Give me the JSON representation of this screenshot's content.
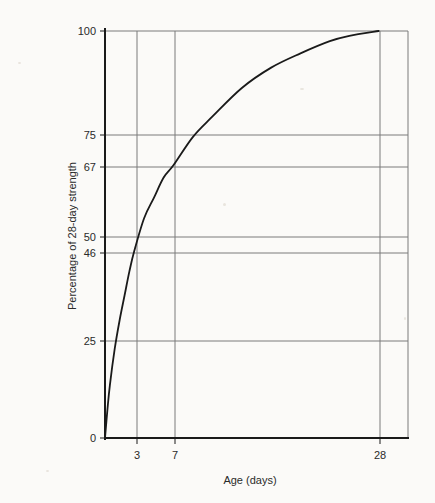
{
  "chart_data": {
    "type": "line",
    "title": "",
    "subtitle": "",
    "xlabel": "Age (days)",
    "ylabel": "Percentage of 28-day strength",
    "xlim": [
      0,
      31
    ],
    "ylim": [
      0,
      100
    ],
    "grid": true,
    "legend": "none",
    "x_ticks": [
      {
        "value": 3,
        "label": "3"
      },
      {
        "value": 7,
        "label": "7"
      },
      {
        "value": 28,
        "label": "28"
      }
    ],
    "y_ticks": [
      {
        "value": 0,
        "label": "0"
      },
      {
        "value": 25,
        "label": "25"
      },
      {
        "value": 46,
        "label": "46"
      },
      {
        "value": 50,
        "label": "50"
      },
      {
        "value": 67,
        "label": "67"
      },
      {
        "value": 75,
        "label": "75"
      },
      {
        "value": 100,
        "label": "100"
      }
    ],
    "x_gridlines": [
      3,
      7,
      28
    ],
    "y_gridlines": [
      25,
      46,
      50,
      67,
      75,
      100
    ],
    "series": [
      {
        "name": "Strength gain curve",
        "color": "#1a1a1a",
        "x": [
          0,
          0.25,
          0.5,
          1,
          1.5,
          2,
          2.5,
          3,
          4,
          5,
          6,
          7,
          9,
          11,
          14,
          17,
          20,
          23,
          25,
          28
        ],
        "y": [
          0,
          7,
          13,
          22,
          29,
          35,
          41,
          46,
          54,
          59,
          64,
          67,
          74,
          79,
          86,
          91,
          94.5,
          97.5,
          98.8,
          100
        ]
      }
    ],
    "annotations": [
      {
        "label": "3-day strength",
        "x": 3,
        "y": 46
      },
      {
        "label": "7-day strength",
        "x": 7,
        "y": 67
      },
      {
        "label": "28-day strength",
        "x": 28,
        "y": 100
      }
    ],
    "colors": {
      "background": "#fbfaf8",
      "axis": "#1a1a1a",
      "grid": "#7a7a7a",
      "curve": "#1a1a1a",
      "text": "#2a2a2a"
    }
  }
}
